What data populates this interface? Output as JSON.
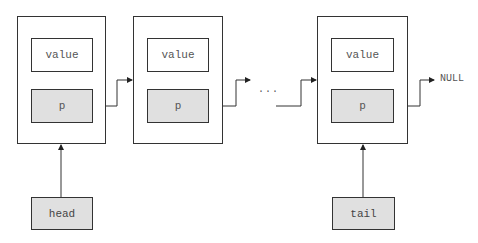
{
  "diagram": {
    "type": "singly-linked-list",
    "nodes": [
      {
        "id": "node-1",
        "value_label": "value",
        "pointer_label": "p"
      },
      {
        "id": "node-2",
        "value_label": "value",
        "pointer_label": "p"
      },
      {
        "id": "node-3",
        "value_label": "value",
        "pointer_label": "p"
      }
    ],
    "ellipsis": "...",
    "terminator": "NULL",
    "head_label": "head",
    "tail_label": "tail",
    "colors": {
      "stroke": "#333333",
      "pointer_fill": "#e0e0e0",
      "value_fill": "#ffffff",
      "text": "#555555"
    }
  }
}
